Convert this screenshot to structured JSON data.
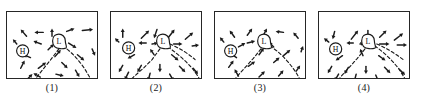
{
  "figure": {
    "type": "weather-map-multiple-choice-panels",
    "panel_count": 4,
    "panel_size_px": {
      "width": 92,
      "height": 68
    },
    "colors": {
      "ink": "#1b1b1b",
      "border": "#262626",
      "background": "#ffffff"
    },
    "legend": {
      "high_symbol": "H",
      "low_symbol": "L",
      "high_meaning": "high-pressure-center",
      "low_meaning": "low-pressure-center",
      "dashed_line_meaning": "frontal-boundary",
      "arrow_meaning": "surface-wind-direction"
    }
  },
  "panels": [
    {
      "caption": "(1)",
      "high": {
        "label": "H",
        "x": 16,
        "y": 40
      },
      "low": {
        "label": "L",
        "x": 53,
        "y": 31
      },
      "fronts": [
        {
          "name": "front-southwest",
          "path": "M53,38 L44,50 L36,60 L28,70 L24,79"
        },
        {
          "name": "front-southeast",
          "path": "M57,35 C66,41 76,52 82,63 C85,68 88,73 90,77"
        }
      ],
      "arrows": [
        {
          "x1": 20,
          "y1": 25,
          "x2": 14,
          "y2": 18
        },
        {
          "x1": 37,
          "y1": 21,
          "x2": 28,
          "y2": 21
        },
        {
          "x1": 46,
          "y1": 25,
          "x2": 46,
          "y2": 17
        },
        {
          "x1": 61,
          "y1": 20,
          "x2": 69,
          "y2": 17
        },
        {
          "x1": 77,
          "y1": 19,
          "x2": 88,
          "y2": 18
        },
        {
          "x1": 35,
          "y1": 33,
          "x2": 27,
          "y2": 30
        },
        {
          "x1": 42,
          "y1": 39,
          "x2": 48,
          "y2": 33
        },
        {
          "x1": 63,
          "y1": 32,
          "x2": 71,
          "y2": 37
        },
        {
          "x1": 10,
          "y1": 33,
          "x2": 6,
          "y2": 28
        },
        {
          "x1": 24,
          "y1": 47,
          "x2": 17,
          "y2": 44
        },
        {
          "x1": 49,
          "y1": 46,
          "x2": 55,
          "y2": 39
        },
        {
          "x1": 72,
          "y1": 44,
          "x2": 79,
          "y2": 50
        },
        {
          "x1": 87,
          "y1": 38,
          "x2": 90,
          "y2": 45
        },
        {
          "x1": 14,
          "y1": 58,
          "x2": 18,
          "y2": 50
        },
        {
          "x1": 32,
          "y1": 58,
          "x2": 40,
          "y2": 52
        },
        {
          "x1": 56,
          "y1": 52,
          "x2": 62,
          "y2": 58
        },
        {
          "x1": 34,
          "y1": 67,
          "x2": 27,
          "y2": 63
        },
        {
          "x1": 50,
          "y1": 64,
          "x2": 58,
          "y2": 66
        },
        {
          "x1": 70,
          "y1": 60,
          "x2": 74,
          "y2": 67
        },
        {
          "x1": 20,
          "y1": 70,
          "x2": 26,
          "y2": 64
        }
      ]
    },
    {
      "caption": "(2)",
      "high": {
        "label": "H",
        "x": 18,
        "y": 37
      },
      "low": {
        "label": "L",
        "x": 53,
        "y": 31
      },
      "fronts": [
        {
          "name": "front-southwest",
          "path": "M50,38 L42,49 L33,58 L23,67 L16,74"
        },
        {
          "name": "front-southeast",
          "path": "M58,36 C67,42 76,50 83,58 C86,62 89,66 91,70"
        },
        {
          "name": "front-east",
          "path": "M60,33 C70,37 79,43 86,49"
        }
      ],
      "arrows": [
        {
          "x1": 12,
          "y1": 26,
          "x2": 12,
          "y2": 17
        },
        {
          "x1": 31,
          "y1": 27,
          "x2": 39,
          "y2": 19
        },
        {
          "x1": 47,
          "y1": 18,
          "x2": 44,
          "y2": 27
        },
        {
          "x1": 58,
          "y1": 27,
          "x2": 65,
          "y2": 18
        },
        {
          "x1": 76,
          "y1": 28,
          "x2": 84,
          "y2": 21
        },
        {
          "x1": 36,
          "y1": 32,
          "x2": 28,
          "y2": 32
        },
        {
          "x1": 42,
          "y1": 33,
          "x2": 48,
          "y2": 32
        },
        {
          "x1": 64,
          "y1": 33,
          "x2": 73,
          "y2": 33
        },
        {
          "x1": 83,
          "y1": 35,
          "x2": 90,
          "y2": 34
        },
        {
          "x1": 8,
          "y1": 31,
          "x2": 4,
          "y2": 27
        },
        {
          "x1": 24,
          "y1": 44,
          "x2": 17,
          "y2": 48
        },
        {
          "x1": 44,
          "y1": 44,
          "x2": 40,
          "y2": 38
        },
        {
          "x1": 62,
          "y1": 44,
          "x2": 69,
          "y2": 50
        },
        {
          "x1": 12,
          "y1": 55,
          "x2": 8,
          "y2": 62
        },
        {
          "x1": 31,
          "y1": 55,
          "x2": 27,
          "y2": 62
        },
        {
          "x1": 50,
          "y1": 54,
          "x2": 50,
          "y2": 62
        },
        {
          "x1": 70,
          "y1": 56,
          "x2": 76,
          "y2": 62
        },
        {
          "x1": 18,
          "y1": 62,
          "x2": 14,
          "y2": 70
        },
        {
          "x1": 40,
          "y1": 63,
          "x2": 38,
          "y2": 71
        },
        {
          "x1": 60,
          "y1": 64,
          "x2": 64,
          "y2": 71
        },
        {
          "x1": 84,
          "y1": 58,
          "x2": 89,
          "y2": 64
        }
      ]
    },
    {
      "caption": "(3)",
      "high": {
        "label": "H",
        "x": 16,
        "y": 40
      },
      "low": {
        "label": "L",
        "x": 50,
        "y": 31
      },
      "fronts": [
        {
          "name": "front-southwest",
          "path": "M47,38 L39,48 L30,58 L22,67 L16,75"
        },
        {
          "name": "front-southeast",
          "path": "M56,35 C66,41 75,51 82,61 C85,66 88,71 90,76"
        }
      ],
      "arrows": [
        {
          "x1": 20,
          "y1": 26,
          "x2": 15,
          "y2": 19
        },
        {
          "x1": 33,
          "y1": 24,
          "x2": 38,
          "y2": 17
        },
        {
          "x1": 49,
          "y1": 25,
          "x2": 53,
          "y2": 17
        },
        {
          "x1": 70,
          "y1": 21,
          "x2": 62,
          "y2": 20
        },
        {
          "x1": 85,
          "y1": 27,
          "x2": 80,
          "y2": 21
        },
        {
          "x1": 33,
          "y1": 32,
          "x2": 41,
          "y2": 30
        },
        {
          "x1": 24,
          "y1": 36,
          "x2": 31,
          "y2": 32
        },
        {
          "x1": 60,
          "y1": 36,
          "x2": 55,
          "y2": 31
        },
        {
          "x1": 9,
          "y1": 31,
          "x2": 5,
          "y2": 26
        },
        {
          "x1": 22,
          "y1": 47,
          "x2": 16,
          "y2": 43
        },
        {
          "x1": 45,
          "y1": 44,
          "x2": 50,
          "y2": 37
        },
        {
          "x1": 70,
          "y1": 45,
          "x2": 77,
          "y2": 39
        },
        {
          "x1": 88,
          "y1": 41,
          "x2": 90,
          "y2": 35
        },
        {
          "x1": 14,
          "y1": 57,
          "x2": 19,
          "y2": 50
        },
        {
          "x1": 34,
          "y1": 56,
          "x2": 41,
          "y2": 51
        },
        {
          "x1": 60,
          "y1": 52,
          "x2": 66,
          "y2": 47
        },
        {
          "x1": 24,
          "y1": 66,
          "x2": 20,
          "y2": 59
        },
        {
          "x1": 45,
          "y1": 67,
          "x2": 51,
          "y2": 61
        },
        {
          "x1": 65,
          "y1": 66,
          "x2": 70,
          "y2": 60
        },
        {
          "x1": 83,
          "y1": 61,
          "x2": 87,
          "y2": 55
        }
      ]
    },
    {
      "caption": "(4)",
      "high": {
        "label": "H",
        "x": 17,
        "y": 38
      },
      "low": {
        "label": "L",
        "x": 50,
        "y": 31
      },
      "fronts": [
        {
          "name": "front-southwest",
          "path": "M47,38 L39,48 L30,58 L22,67 L16,75"
        },
        {
          "name": "front-southeast",
          "path": "M57,35 C66,41 75,50 82,59 C85,64 88,69 91,74"
        },
        {
          "name": "front-east",
          "path": "M59,33 C69,37 78,43 86,49"
        }
      ],
      "arrows": [
        {
          "x1": 16,
          "y1": 20,
          "x2": 14,
          "y2": 28
        },
        {
          "x1": 33,
          "y1": 28,
          "x2": 40,
          "y2": 19
        },
        {
          "x1": 50,
          "y1": 19,
          "x2": 50,
          "y2": 28
        },
        {
          "x1": 62,
          "y1": 26,
          "x2": 69,
          "y2": 19
        },
        {
          "x1": 77,
          "y1": 29,
          "x2": 86,
          "y2": 22
        },
        {
          "x1": 35,
          "y1": 32,
          "x2": 28,
          "y2": 32
        },
        {
          "x1": 42,
          "y1": 33,
          "x2": 46,
          "y2": 32
        },
        {
          "x1": 62,
          "y1": 33,
          "x2": 72,
          "y2": 33
        },
        {
          "x1": 80,
          "y1": 34,
          "x2": 90,
          "y2": 34
        },
        {
          "x1": 10,
          "y1": 31,
          "x2": 5,
          "y2": 27
        },
        {
          "x1": 24,
          "y1": 45,
          "x2": 17,
          "y2": 50
        },
        {
          "x1": 45,
          "y1": 45,
          "x2": 42,
          "y2": 38
        },
        {
          "x1": 61,
          "y1": 45,
          "x2": 68,
          "y2": 50
        },
        {
          "x1": 13,
          "y1": 56,
          "x2": 9,
          "y2": 63
        },
        {
          "x1": 30,
          "y1": 57,
          "x2": 26,
          "y2": 64
        },
        {
          "x1": 48,
          "y1": 56,
          "x2": 48,
          "y2": 64
        },
        {
          "x1": 67,
          "y1": 57,
          "x2": 73,
          "y2": 63
        },
        {
          "x1": 20,
          "y1": 64,
          "x2": 16,
          "y2": 71
        },
        {
          "x1": 38,
          "y1": 64,
          "x2": 36,
          "y2": 72
        },
        {
          "x1": 58,
          "y1": 65,
          "x2": 61,
          "y2": 72
        },
        {
          "x1": 82,
          "y1": 59,
          "x2": 88,
          "y2": 65
        }
      ]
    }
  ]
}
